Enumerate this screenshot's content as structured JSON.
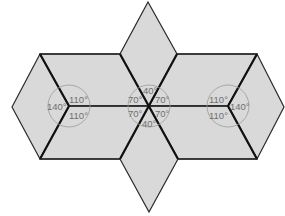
{
  "diagram": {
    "type": "geometric tessellation of rhombi",
    "colors": {
      "fill": "#d9d9d9",
      "stroke": "#2a2a2a",
      "angle_circle": "#9a9a9a",
      "label": "#6e6e6e"
    },
    "vertices": {
      "left": {
        "angles": {
          "left": "140°",
          "upper_right": "110°",
          "lower_right": "110°"
        }
      },
      "center": {
        "angles": {
          "top": "40°",
          "upper_left": "70°",
          "upper_right": "70°",
          "lower_left": "70°",
          "lower_right": "70°",
          "bottom": "40°"
        }
      },
      "right": {
        "angles": {
          "upper_left": "110°",
          "right": "140°",
          "lower_left": "110°"
        }
      }
    }
  }
}
